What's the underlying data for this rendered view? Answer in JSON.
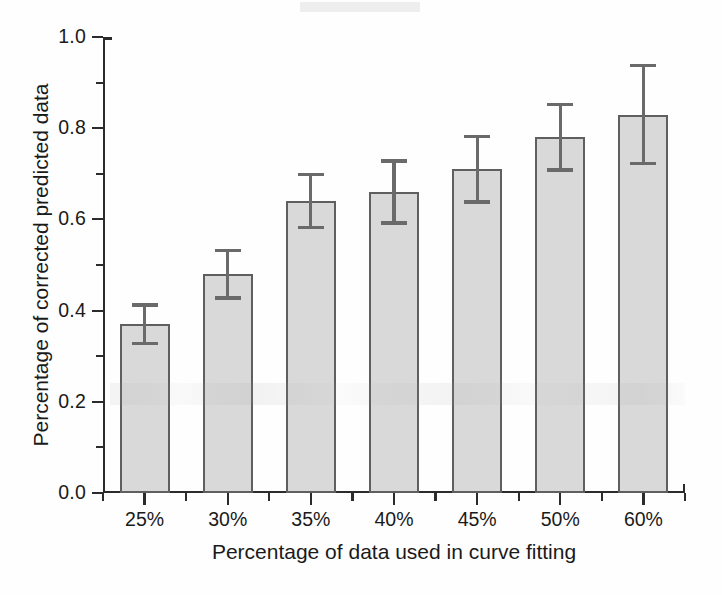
{
  "chart_data": {
    "type": "bar",
    "title": "",
    "xlabel": "Percentage of data used in curve fitting",
    "ylabel": "Percentage of corrected predicted data",
    "categories": [
      "25%",
      "30%",
      "35%",
      "40%",
      "45%",
      "50%",
      "60%"
    ],
    "values": [
      0.37,
      0.48,
      0.64,
      0.66,
      0.71,
      0.78,
      0.83
    ],
    "errors": [
      0.042,
      0.052,
      0.058,
      0.068,
      0.072,
      0.072,
      0.107
    ],
    "ylim": [
      0.0,
      1.0
    ],
    "ytick_labels": [
      "0.0",
      "0.2",
      "0.4",
      "0.6",
      "0.8",
      "1.0"
    ],
    "ytick_values": [
      0.0,
      0.2,
      0.4,
      0.6,
      0.8,
      1.0
    ],
    "yminor_values": [
      0.1,
      0.3,
      0.5,
      0.7,
      0.9
    ],
    "grid": false,
    "legend": false,
    "legend_position": "none",
    "error_bar_style": "symmetric-caps",
    "bar_fill_color": "#d9d9d9",
    "bar_border_color": "#5f5f5f",
    "error_bar_color": "#6a6a6a",
    "axis_color": "#2b2b2b"
  }
}
